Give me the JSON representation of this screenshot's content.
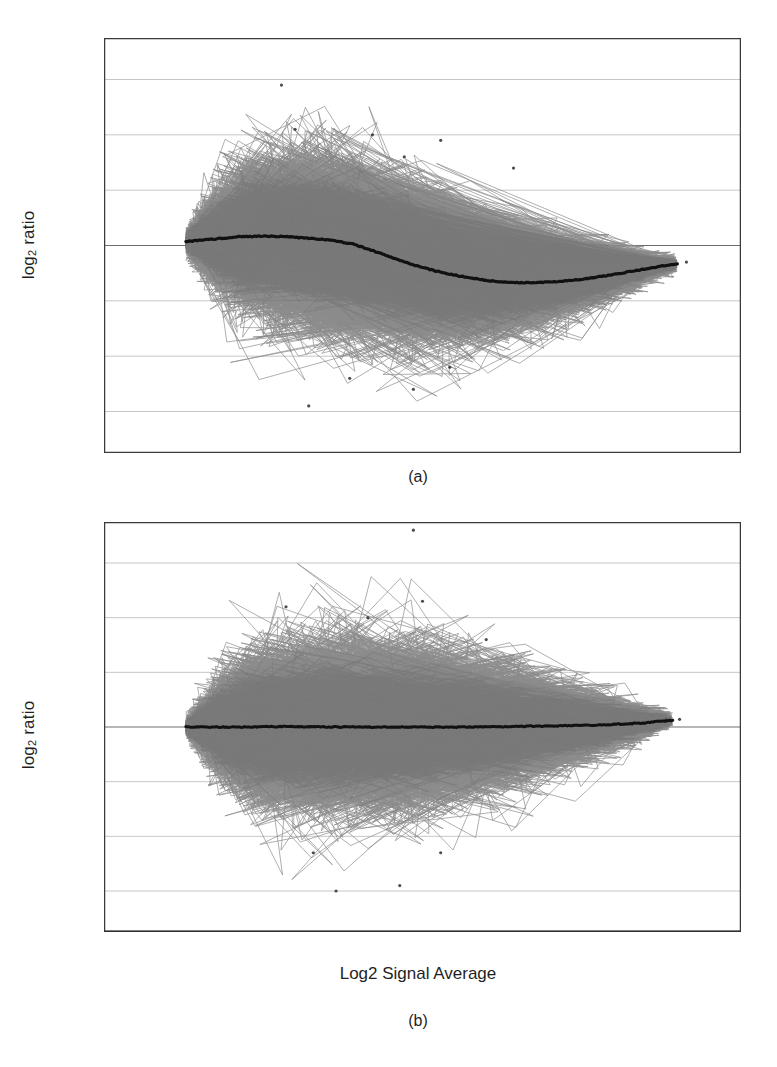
{
  "figure": {
    "type": "multi-panel-scatter",
    "panels": [
      {
        "id": "a",
        "caption": "(a)"
      },
      {
        "id": "b",
        "caption": "(b)"
      }
    ]
  },
  "axes": {
    "ylabel_prefix": "log",
    "ylabel_sub": "2",
    "ylabel_suffix": " ratio",
    "ylabel_full": "log2 ratio",
    "xlabel": "Log2 Signal Average",
    "x_ticks": [
      "2",
      "3",
      "4",
      "5",
      "6",
      "7",
      "8",
      "9",
      "10",
      "11",
      "12",
      "13",
      "14",
      "15",
      "16"
    ],
    "y_ticks": [
      "3",
      "2",
      "1",
      "0",
      "−1",
      "−2",
      "−3"
    ]
  },
  "colors": {
    "point_cloud": "#8c8c8c",
    "trend_line": "#111111",
    "frame": "#3a3a3a",
    "gridline": "#b8b8b8",
    "zero_line": "#6e6e6e",
    "background": "#ffffff",
    "text": "#1f1f1f"
  },
  "chart_data": [
    {
      "id": "a",
      "type": "scatter",
      "title": "",
      "xlabel": "",
      "ylabel": "log2 ratio",
      "xlim": [
        2,
        16
      ],
      "ylim": [
        -3.75,
        3.75
      ],
      "xticks": [
        2,
        3,
        4,
        5,
        6,
        7,
        8,
        9,
        10,
        11,
        12,
        13,
        14,
        15,
        16
      ],
      "yticks": [
        -3,
        -2,
        -1,
        0,
        1,
        2,
        3
      ],
      "grid": true,
      "legend": "none",
      "annotations": [
        "(a)"
      ],
      "n_points_approx": 22000,
      "cloud": {
        "x_start": 3.8,
        "x_end": 14.6,
        "description": "dense gray cloud of microarray probes, widest spread between log2 signal 5 and 9, narrowing toward high intensity",
        "spread_profile": {
          "x": [
            3.8,
            4.5,
            5.0,
            6.0,
            7.0,
            8.0,
            9.0,
            10.0,
            11.0,
            12.0,
            13.0,
            14.0,
            14.6
          ],
          "sd": [
            0.08,
            0.38,
            0.52,
            0.6,
            0.62,
            0.6,
            0.55,
            0.47,
            0.38,
            0.28,
            0.19,
            0.1,
            0.05
          ]
        },
        "center_profile": {
          "x": [
            3.8,
            4.2,
            4.6,
            5.0,
            5.5,
            6.0,
            6.5,
            7.0,
            7.5,
            8.0,
            8.5,
            9.0,
            9.5,
            10.0,
            10.5,
            11.0,
            11.5,
            12.0,
            12.5,
            13.0,
            13.5,
            14.0,
            14.4,
            14.6
          ],
          "y": [
            0.07,
            0.1,
            0.13,
            0.16,
            0.17,
            0.16,
            0.13,
            0.1,
            0.02,
            -0.12,
            -0.27,
            -0.4,
            -0.5,
            -0.58,
            -0.64,
            -0.67,
            -0.67,
            -0.65,
            -0.61,
            -0.55,
            -0.48,
            -0.41,
            -0.35,
            -0.33
          ]
        }
      },
      "trend_line": {
        "label": "lowess fit",
        "x": [
          3.8,
          4.2,
          4.6,
          5.0,
          5.5,
          6.0,
          6.5,
          7.0,
          7.5,
          8.0,
          8.5,
          9.0,
          9.5,
          10.0,
          10.5,
          11.0,
          11.5,
          12.0,
          12.5,
          13.0,
          13.5,
          14.0,
          14.4,
          14.6
        ],
        "y": [
          0.07,
          0.1,
          0.13,
          0.16,
          0.17,
          0.16,
          0.13,
          0.1,
          0.02,
          -0.12,
          -0.27,
          -0.4,
          -0.5,
          -0.58,
          -0.64,
          -0.67,
          -0.67,
          -0.65,
          -0.61,
          -0.55,
          -0.48,
          -0.41,
          -0.35,
          -0.33
        ]
      },
      "outliers": [
        {
          "x": 5.9,
          "y": 2.9
        },
        {
          "x": 6.2,
          "y": 2.1
        },
        {
          "x": 7.9,
          "y": 2.0
        },
        {
          "x": 8.6,
          "y": 1.6
        },
        {
          "x": 9.4,
          "y": 1.9
        },
        {
          "x": 11.0,
          "y": 1.4
        },
        {
          "x": 6.5,
          "y": -2.9
        },
        {
          "x": 7.4,
          "y": -2.4
        },
        {
          "x": 8.8,
          "y": -2.6
        },
        {
          "x": 9.6,
          "y": -2.2
        },
        {
          "x": 14.8,
          "y": -0.3
        }
      ]
    },
    {
      "id": "b",
      "type": "scatter",
      "title": "",
      "xlabel": "Log2 Signal Average",
      "ylabel": "log2 ratio",
      "xlim": [
        2,
        16
      ],
      "ylim": [
        -3.75,
        3.75
      ],
      "xticks": [
        2,
        3,
        4,
        5,
        6,
        7,
        8,
        9,
        10,
        11,
        12,
        13,
        14,
        15,
        16
      ],
      "yticks": [
        -3,
        -2,
        -1,
        0,
        1,
        2,
        3
      ],
      "grid": true,
      "legend": "none",
      "annotations": [
        "(b)"
      ],
      "n_points_approx": 22000,
      "cloud": {
        "x_start": 3.8,
        "x_end": 14.5,
        "description": "lowess-normalized data; gray cloud symmetric about zero across the full intensity range",
        "spread_profile": {
          "x": [
            3.8,
            4.5,
            5.0,
            6.0,
            7.0,
            8.0,
            9.0,
            10.0,
            11.0,
            12.0,
            13.0,
            14.0,
            14.5
          ],
          "sd": [
            0.06,
            0.36,
            0.5,
            0.58,
            0.6,
            0.59,
            0.55,
            0.48,
            0.4,
            0.3,
            0.2,
            0.1,
            0.05
          ]
        },
        "center_profile": {
          "x": [
            3.8,
            5.0,
            6.0,
            7.0,
            8.0,
            9.0,
            10.0,
            11.0,
            12.0,
            13.0,
            13.8,
            14.3,
            14.5
          ],
          "y": [
            0.0,
            0.0,
            0.01,
            0.0,
            0.0,
            0.0,
            0.0,
            0.01,
            0.02,
            0.04,
            0.07,
            0.11,
            0.12
          ]
        }
      },
      "trend_line": {
        "label": "lowess fit",
        "x": [
          3.8,
          5.0,
          6.0,
          7.0,
          8.0,
          9.0,
          10.0,
          11.0,
          12.0,
          13.0,
          13.8,
          14.3,
          14.5
        ],
        "y": [
          0.0,
          0.0,
          0.01,
          0.0,
          0.0,
          0.0,
          0.0,
          0.01,
          0.02,
          0.04,
          0.07,
          0.11,
          0.12
        ]
      },
      "outliers": [
        {
          "x": 8.8,
          "y": 3.6
        },
        {
          "x": 6.0,
          "y": 2.2
        },
        {
          "x": 7.8,
          "y": 2.0
        },
        {
          "x": 9.0,
          "y": 2.3
        },
        {
          "x": 10.4,
          "y": 1.6
        },
        {
          "x": 6.6,
          "y": -2.3
        },
        {
          "x": 7.1,
          "y": -3.0
        },
        {
          "x": 8.5,
          "y": -2.9
        },
        {
          "x": 9.4,
          "y": -2.3
        },
        {
          "x": 14.35,
          "y": 0.13
        },
        {
          "x": 14.65,
          "y": 0.14
        }
      ]
    }
  ]
}
